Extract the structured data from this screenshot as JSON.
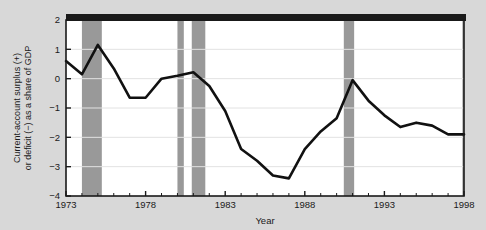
{
  "figure": {
    "background_color": "#d8d8d8",
    "plot_background_color": "#ffffff",
    "line_color": "#111111",
    "band_color": "#999999",
    "header_bar_color": "#1a1a1a",
    "grid_color": "#e2e2e2",
    "axis_color": "#1a1a1a"
  },
  "chart_data": {
    "type": "line",
    "title": "",
    "xlabel": "Year",
    "ylabel": "Current-account surplus (+)\nor deficit (−) as a share of GDP",
    "ylabel_line1": "Current-account surplus (+)",
    "ylabel_line2": "or deficit (−) as a share of GDP",
    "xlim": [
      1973,
      1998
    ],
    "ylim": [
      -4,
      2
    ],
    "xticks": [
      1973,
      1978,
      1983,
      1988,
      1993,
      1998
    ],
    "xtick_labels": [
      "1973",
      "1978",
      "1983",
      "1988",
      "1993",
      "1998"
    ],
    "minor_xtick_interval": 1,
    "yticks": [
      2,
      1,
      0,
      -1,
      -2,
      -3,
      -4
    ],
    "ytick_labels": [
      "2",
      "1",
      "0",
      "−1",
      "−2",
      "−3",
      "−4"
    ],
    "grid": true,
    "grid_axis": "y",
    "legend": null,
    "x": [
      1973,
      1974,
      1975,
      1976,
      1977,
      1978,
      1979,
      1980,
      1981,
      1982,
      1983,
      1984,
      1985,
      1986,
      1987,
      1988,
      1989,
      1990,
      1991,
      1992,
      1993,
      1994,
      1995,
      1996,
      1997,
      1998
    ],
    "values": [
      0.6,
      0.15,
      1.15,
      0.35,
      -0.65,
      -0.65,
      0.0,
      0.1,
      0.22,
      -0.25,
      -1.1,
      -2.4,
      -2.8,
      -3.3,
      -3.4,
      -2.4,
      -1.8,
      -1.35,
      -0.05,
      -0.75,
      -1.25,
      -1.65,
      -1.5,
      -1.6,
      -1.9,
      -1.9
    ],
    "series": [
      {
        "name": "Current-account balance (% of GDP)",
        "values": [
          0.6,
          0.15,
          1.15,
          0.35,
          -0.65,
          -0.65,
          0.0,
          0.1,
          0.22,
          -0.25,
          -1.1,
          -2.4,
          -2.8,
          -3.3,
          -3.4,
          -2.4,
          -1.8,
          -1.35,
          -0.05,
          -0.75,
          -1.25,
          -1.65,
          -1.5,
          -1.6,
          -1.9,
          -1.9
        ]
      }
    ],
    "shaded_bands": [
      {
        "label": "recession-band-1",
        "start": 1974.0,
        "end": 1975.25
      },
      {
        "label": "recession-band-2",
        "start": 1980.0,
        "end": 1980.4
      },
      {
        "label": "recession-band-3",
        "start": 1980.9,
        "end": 1981.75
      },
      {
        "label": "recession-band-4",
        "start": 1990.45,
        "end": 1991.1
      },
      {
        "label": "recession-band-5",
        "start": 1997.9,
        "end": 1998.0
      }
    ],
    "annotations": []
  }
}
